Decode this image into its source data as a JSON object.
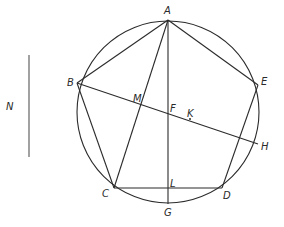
{
  "diagram": {
    "type": "geometry",
    "labels": {
      "A": "A",
      "B": "B",
      "C": "C",
      "D": "D",
      "E": "E",
      "F": "F",
      "G": "G",
      "H": "H",
      "K": "K",
      "L": "L",
      "M": "M",
      "N": "N"
    },
    "points": {
      "A": [
        168,
        20
      ],
      "B": [
        77,
        83
      ],
      "C": [
        114,
        188
      ],
      "D": [
        222,
        188
      ],
      "E": [
        258,
        85
      ],
      "F": [
        168,
        112
      ],
      "G": [
        168,
        204
      ],
      "H": [
        258,
        144
      ],
      "K": [
        190,
        119
      ],
      "L": [
        168,
        188
      ],
      "M": [
        141,
        104
      ]
    },
    "circle": {
      "center": [
        168,
        112
      ],
      "radius": 91
    },
    "segments": [
      "AB",
      "AE",
      "BC",
      "CD",
      "DE",
      "AC",
      "AD",
      "AG",
      "BH",
      "CD"
    ],
    "standalone_line": {
      "label": "N",
      "from": [
        29,
        55
      ],
      "to": [
        29,
        157
      ]
    },
    "colors": {
      "stroke": "#2b2b2b",
      "n_line": "#7a7a7a",
      "background": "#ffffff"
    }
  }
}
